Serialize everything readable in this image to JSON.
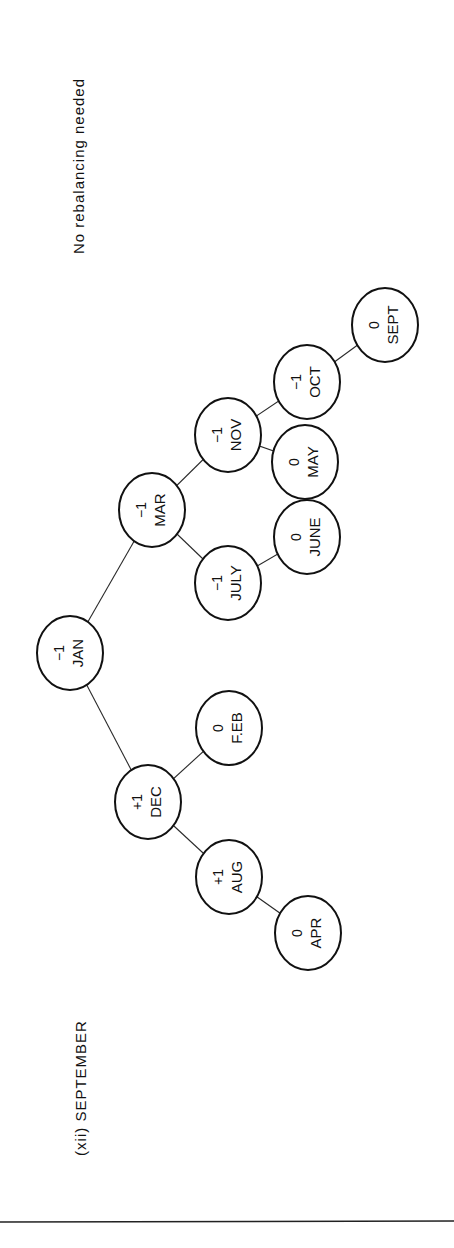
{
  "figure": {
    "caption": "(xii) SEPTEMBER",
    "note": "No rebalancing needed"
  },
  "tree": {
    "nodes": [
      {
        "id": "jan",
        "name": "JAN",
        "balance": "−1",
        "cx": 70,
        "cy": 653
      },
      {
        "id": "dec",
        "name": "DEC",
        "balance": "+1",
        "cx": 148,
        "cy": 802
      },
      {
        "id": "mar",
        "name": "MAR",
        "balance": "−1",
        "cx": 152,
        "cy": 510
      },
      {
        "id": "aug",
        "name": "AUG",
        "balance": "+1",
        "cx": 229,
        "cy": 877
      },
      {
        "id": "feb",
        "name": "F.EB",
        "balance": "0",
        "cx": 229,
        "cy": 728
      },
      {
        "id": "july",
        "name": "JULY",
        "balance": "−1",
        "cx": 228,
        "cy": 583
      },
      {
        "id": "nov",
        "name": "NOV",
        "balance": "−1",
        "cx": 228,
        "cy": 435
      },
      {
        "id": "apr",
        "name": "APR",
        "balance": "0",
        "cx": 308,
        "cy": 933
      },
      {
        "id": "june",
        "name": "JUNE",
        "balance": "0",
        "cx": 307,
        "cy": 537
      },
      {
        "id": "may",
        "name": "MAY",
        "balance": "0",
        "cx": 305,
        "cy": 462
      },
      {
        "id": "oct",
        "name": "OCT",
        "balance": "−1",
        "cx": 307,
        "cy": 382
      },
      {
        "id": "sept",
        "name": "SEPT",
        "balance": "0",
        "cx": 385,
        "cy": 325
      }
    ],
    "edges": [
      [
        "jan",
        "dec"
      ],
      [
        "jan",
        "mar"
      ],
      [
        "dec",
        "aug"
      ],
      [
        "dec",
        "feb"
      ],
      [
        "aug",
        "apr"
      ],
      [
        "mar",
        "july"
      ],
      [
        "mar",
        "nov"
      ],
      [
        "july",
        "june"
      ],
      [
        "nov",
        "may"
      ],
      [
        "nov",
        "oct"
      ],
      [
        "oct",
        "sept"
      ]
    ]
  }
}
